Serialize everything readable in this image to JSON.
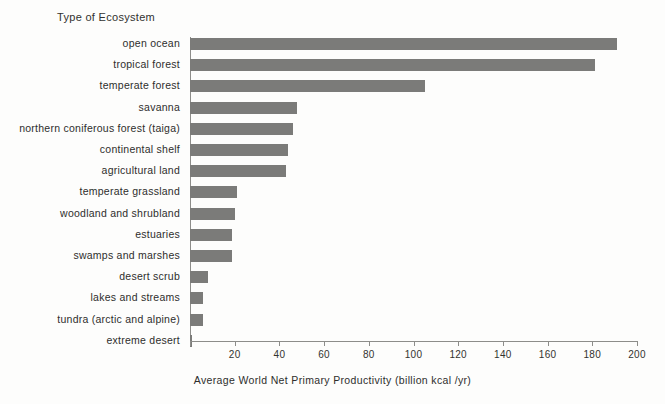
{
  "chart_data": {
    "type": "bar",
    "orientation": "horizontal",
    "title": "",
    "xlabel": "Average World Net Primary Productivity (billion kcal /yr)",
    "ylabel": "Type of Ecosystem",
    "xlim": [
      0,
      200
    ],
    "xticks": [
      0,
      20,
      40,
      60,
      80,
      100,
      120,
      140,
      160,
      180,
      200
    ],
    "xtick_labels": [
      "",
      "20",
      "40",
      "60",
      "80",
      "100",
      "120",
      "140",
      "160",
      "180",
      "200"
    ],
    "grid": false,
    "legend": null,
    "bar_color": "#7b7b79",
    "background_color": "#fdfdfc",
    "categories": [
      "open ocean",
      "tropical forest",
      "temperate forest",
      "savanna",
      "northern coniferous forest (taiga)",
      "continental shelf",
      "agricultural land",
      "temperate grassland",
      "woodland and shrubland",
      "estuaries",
      "swamps and marshes",
      "desert scrub",
      "lakes and streams",
      "tundra (arctic and alpine)",
      "extreme desert"
    ],
    "values": [
      191,
      181,
      105,
      48,
      46,
      44,
      43,
      21,
      20,
      19,
      19,
      8,
      6,
      6,
      1
    ]
  }
}
